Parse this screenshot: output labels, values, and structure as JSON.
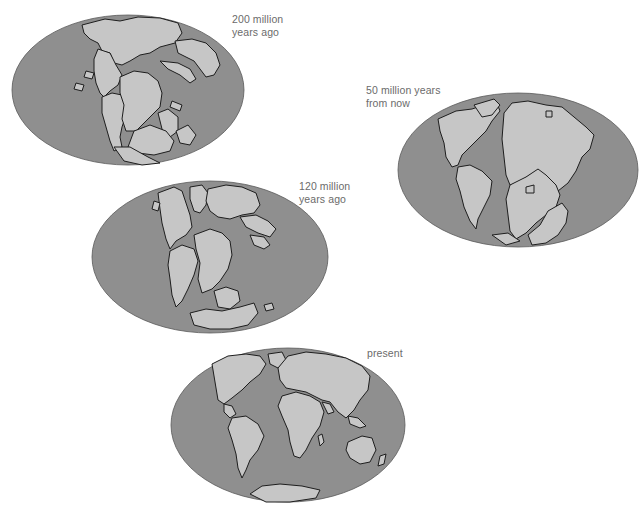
{
  "figure": {
    "colors": {
      "background": "#ffffff",
      "ocean": "#8f8f8f",
      "land": "#c6c6c6",
      "coastline": "#1e1e1e",
      "label_text": "#6b6b6b"
    },
    "panels": [
      {
        "id": "200-million-years-ago",
        "label_line1": "200 million",
        "label_line2": "years ago"
      },
      {
        "id": "50-million-years-from-now",
        "label_line1": "50 million years",
        "label_line2": "from now"
      },
      {
        "id": "120-million-years-ago",
        "label_line1": "120 million",
        "label_line2": "years ago"
      },
      {
        "id": "present",
        "label_line1": "present",
        "label_line2": ""
      }
    ]
  }
}
